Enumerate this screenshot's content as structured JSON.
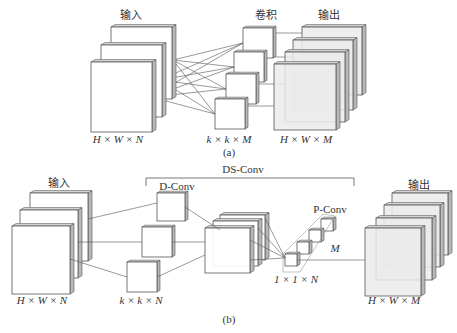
{
  "figure_a": {
    "caption": "(a)",
    "input_title": "输入",
    "conv_title": "卷积",
    "output_title": "输出",
    "input_dim": "H × W × N",
    "kernel_dim": "k × k × M",
    "output_dim": "H × W × M"
  },
  "figure_b": {
    "caption": "(b)",
    "input_title": "输入",
    "output_title": "输出",
    "ds_conv_label": "DS-Conv",
    "d_conv_label": "D-Conv",
    "p_conv_label": "P-Conv",
    "p_conv_count": "M",
    "input_dim": "H × W × N",
    "depthwise_dim": "k × k × N",
    "pointwise_dim": "1 × 1 × N",
    "output_dim": "H × W × M"
  },
  "colors": {
    "stroke": "#555555",
    "card_fill": "#ffffff",
    "card_side": "#b8b8b8",
    "output_fill": "#ebebeb"
  }
}
